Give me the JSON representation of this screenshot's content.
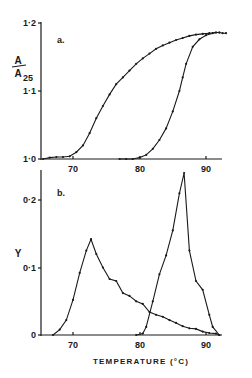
{
  "chart_data": [
    {
      "type": "line",
      "panel_label": "a.",
      "title": "",
      "xlabel": "",
      "ylabel": "A/A25",
      "ylabel_parts": {
        "numerator": "A",
        "denominator": "A",
        "subscript": "25"
      },
      "xlim": [
        64,
        94
      ],
      "ylim": [
        1.0,
        1.2
      ],
      "xticks": [
        "70",
        "80",
        "90"
      ],
      "yticks": [
        "1·0",
        "1·1",
        "1·2"
      ],
      "grid": false,
      "legend": null,
      "series": [
        {
          "name": "curve-1",
          "x": [
            65.5,
            66.5,
            67.5,
            68.5,
            69.5,
            70.5,
            71.5,
            72.5,
            73.5,
            74.5,
            75.5,
            76.5,
            77.5,
            78.5,
            79.5,
            80.5,
            81.5,
            82.5,
            83.5,
            84.5,
            85.5,
            86.5,
            87.5,
            88.5,
            89.5,
            90.5,
            91.5,
            92.0,
            92.5,
            93.0
          ],
          "y": [
            1.0,
            1.002,
            1.003,
            1.003,
            1.004,
            1.01,
            1.02,
            1.038,
            1.06,
            1.078,
            1.095,
            1.11,
            1.12,
            1.13,
            1.14,
            1.148,
            1.155,
            1.162,
            1.167,
            1.171,
            1.175,
            1.178,
            1.181,
            1.183,
            1.184,
            1.185,
            1.186,
            1.186,
            1.185,
            1.185
          ]
        },
        {
          "name": "curve-2",
          "x": [
            77.0,
            78.0,
            79.0,
            80.0,
            81.0,
            82.0,
            83.0,
            84.0,
            85.0,
            86.0,
            86.5,
            87.0,
            88.0,
            89.0,
            90.0,
            91.0,
            91.5,
            92.0
          ],
          "y": [
            1.0,
            1.0,
            1.0,
            1.002,
            1.006,
            1.015,
            1.028,
            1.045,
            1.07,
            1.1,
            1.12,
            1.14,
            1.165,
            1.176,
            1.182,
            1.185,
            1.186,
            1.186
          ]
        }
      ]
    },
    {
      "type": "line",
      "panel_label": "b.",
      "title": "",
      "xlabel": "TEMPERATURE (°C)",
      "ylabel": "Y",
      "xlim": [
        64,
        94
      ],
      "ylim": [
        0,
        0.25
      ],
      "xticks": [
        "70",
        "80",
        "90"
      ],
      "yticks": [
        "0",
        "0·1",
        "0·2"
      ],
      "grid": false,
      "legend": null,
      "series": [
        {
          "name": "curve-1-derivative",
          "x": [
            67.0,
            68.0,
            69.0,
            70.0,
            71.0,
            72.0,
            72.7,
            73.5,
            74.5,
            75.5,
            76.5,
            77.5,
            78.5,
            79.5,
            80.5,
            81.5,
            82.5,
            83.5,
            84.5,
            85.5,
            86.5,
            87.5,
            88.5,
            89.5,
            90.5,
            91.5,
            92.0
          ],
          "y": [
            0.0,
            0.008,
            0.022,
            0.052,
            0.092,
            0.125,
            0.142,
            0.12,
            0.1,
            0.083,
            0.08,
            0.062,
            0.058,
            0.05,
            0.046,
            0.034,
            0.03,
            0.027,
            0.022,
            0.018,
            0.013,
            0.01,
            0.009,
            0.005,
            0.003,
            0.002,
            0.0
          ]
        },
        {
          "name": "curve-2-derivative",
          "x": [
            79.5,
            80.5,
            81.0,
            82.0,
            83.0,
            84.0,
            85.0,
            86.0,
            86.7,
            87.5,
            88.5,
            89.5,
            90.5,
            91.0,
            92.0
          ],
          "y": [
            0.0,
            0.002,
            0.012,
            0.05,
            0.09,
            0.118,
            0.155,
            0.21,
            0.24,
            0.125,
            0.08,
            0.067,
            0.03,
            0.012,
            0.0
          ]
        }
      ]
    }
  ],
  "panels": {
    "a": {
      "label": "a.",
      "ylabel_num": "A",
      "ylabel_den": "A",
      "ylabel_sub": "25",
      "yticks": [
        "1·2",
        "1·1",
        "1·0"
      ],
      "xticks": [
        "70",
        "80",
        "90"
      ]
    },
    "b": {
      "label": "b.",
      "ylabel": "Y",
      "yticks": [
        "0·2",
        "0·1",
        "0"
      ],
      "xticks": [
        "70",
        "80",
        "90"
      ],
      "xlabel": "TEMPERATURE (°C)"
    }
  }
}
